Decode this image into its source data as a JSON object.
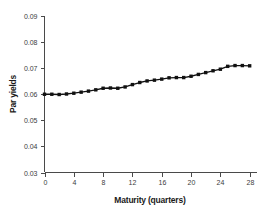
{
  "chart_data": {
    "type": "line",
    "title": "",
    "xlabel": "Maturity (quarters)",
    "ylabel": "Par yields",
    "xlim": [
      0,
      29
    ],
    "ylim": [
      0.03,
      0.09
    ],
    "xticks": [
      0,
      4,
      8,
      12,
      16,
      20,
      24,
      28
    ],
    "xtick_labels": [
      "0",
      "4",
      "8",
      "12",
      "16",
      "20",
      "24",
      "28"
    ],
    "yticks": [
      0.03,
      0.04,
      0.05,
      0.06,
      0.07,
      0.08,
      0.09
    ],
    "ytick_labels": [
      "0.03",
      "0.04",
      "0.05",
      "0.06",
      "0.07",
      "0.08",
      "0.09"
    ],
    "grid": false,
    "legend": false,
    "legend_position": "none",
    "series": [
      {
        "name": "Par yields",
        "marker": "square",
        "color": "#111111",
        "x": [
          0,
          1,
          2,
          3,
          4,
          5,
          6,
          7,
          8,
          9,
          10,
          11,
          12,
          13,
          14,
          15,
          16,
          17,
          18,
          19,
          20,
          21,
          22,
          23,
          24,
          25,
          26,
          27,
          28
        ],
        "values": [
          0.06,
          0.06,
          0.0599,
          0.0601,
          0.0604,
          0.0608,
          0.0612,
          0.0617,
          0.0623,
          0.0624,
          0.0623,
          0.0628,
          0.0637,
          0.0645,
          0.0651,
          0.0654,
          0.0658,
          0.0663,
          0.0664,
          0.0664,
          0.0669,
          0.0676,
          0.0683,
          0.069,
          0.0696,
          0.0707,
          0.071,
          0.071,
          0.0709
        ]
      }
    ]
  },
  "colors": {
    "series": "#111111",
    "axis": "#4a4a4a",
    "text": "#1a1a1a",
    "background": "#ffffff"
  }
}
